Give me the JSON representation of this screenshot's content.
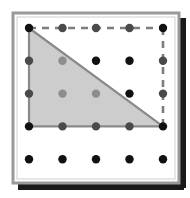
{
  "figure": {
    "title": "Dot grid geoboard with shaded right triangle",
    "canvas": {
      "width": 190,
      "height": 198,
      "background": "#ffffff"
    }
  },
  "frame": {
    "name": "geoboard-frame",
    "x": 13,
    "y": 13,
    "width": 166,
    "height": 170,
    "fill": "#ffffff",
    "border_color": "#9a9a9a",
    "border_width": 3,
    "inner_outline_color": "#cfcfcf"
  },
  "shadow": {
    "name": "drop-shadow",
    "color": "#1a1a1a",
    "offset_x": 5,
    "offset_y": 5,
    "thickness": 7
  },
  "grid": {
    "columns": 5,
    "rows": 5,
    "origin_x": 29,
    "origin_y": 28,
    "spacing_x": 33.5,
    "spacing_y": 32.8,
    "dot_radius": 4.2,
    "dot_color_outside": "#111111",
    "dot_color_inside": "#8d8d8d",
    "dot_color_edge": "#4a4a4a",
    "labels": {
      "columns": [
        "c1",
        "c2",
        "c3",
        "c4",
        "c5"
      ],
      "rows": [
        "r1",
        "r2",
        "r3",
        "r4",
        "r5"
      ]
    },
    "points": [
      {
        "col": 0,
        "row": 0,
        "state": "vertex"
      },
      {
        "col": 1,
        "row": 0,
        "state": "edge"
      },
      {
        "col": 2,
        "row": 0,
        "state": "edge"
      },
      {
        "col": 3,
        "row": 0,
        "state": "edge"
      },
      {
        "col": 4,
        "row": 0,
        "state": "vertex"
      },
      {
        "col": 0,
        "row": 1,
        "state": "edge"
      },
      {
        "col": 1,
        "row": 1,
        "state": "inside"
      },
      {
        "col": 2,
        "row": 1,
        "state": "outside"
      },
      {
        "col": 3,
        "row": 1,
        "state": "outside"
      },
      {
        "col": 4,
        "row": 1,
        "state": "edge"
      },
      {
        "col": 0,
        "row": 2,
        "state": "edge"
      },
      {
        "col": 1,
        "row": 2,
        "state": "inside"
      },
      {
        "col": 2,
        "row": 2,
        "state": "inside"
      },
      {
        "col": 3,
        "row": 2,
        "state": "outside"
      },
      {
        "col": 4,
        "row": 2,
        "state": "edge"
      },
      {
        "col": 0,
        "row": 3,
        "state": "vertex"
      },
      {
        "col": 1,
        "row": 3,
        "state": "edge"
      },
      {
        "col": 2,
        "row": 3,
        "state": "edge"
      },
      {
        "col": 3,
        "row": 3,
        "state": "edge"
      },
      {
        "col": 4,
        "row": 3,
        "state": "vertex"
      },
      {
        "col": 0,
        "row": 4,
        "state": "outside"
      },
      {
        "col": 1,
        "row": 4,
        "state": "outside"
      },
      {
        "col": 2,
        "row": 4,
        "state": "outside"
      },
      {
        "col": 3,
        "row": 4,
        "state": "outside"
      },
      {
        "col": 4,
        "row": 4,
        "state": "outside"
      }
    ]
  },
  "triangle": {
    "name": "shaded-right-triangle",
    "vertices_grid": [
      {
        "col": 0,
        "row": 0
      },
      {
        "col": 0,
        "row": 3
      },
      {
        "col": 4,
        "row": 3
      }
    ],
    "fill": "#cdcdcd",
    "stroke": "#8a8a8a",
    "stroke_width": 2.2
  },
  "dashed_rectangle": {
    "name": "dashed-bounding-rectangle",
    "corners_grid": [
      {
        "col": 0,
        "row": 0
      },
      {
        "col": 4,
        "row": 0
      },
      {
        "col": 4,
        "row": 3
      },
      {
        "col": 0,
        "row": 3
      }
    ],
    "stroke": "#7d7d7d",
    "stroke_width": 2.6,
    "dash_pattern": "7 6",
    "sides_drawn": [
      "top",
      "right"
    ]
  }
}
